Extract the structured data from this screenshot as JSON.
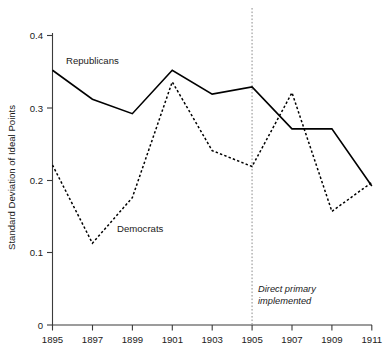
{
  "chart_data": {
    "type": "line",
    "title": "",
    "xlabel": "",
    "ylabel": "Standard Deviation of Ideal Points",
    "x": [
      1895,
      1897,
      1899,
      1901,
      1903,
      1905,
      1907,
      1909,
      1911
    ],
    "xtick_labels": [
      "1895",
      "1897",
      "1899",
      "1901",
      "1903",
      "1905",
      "1907",
      "1909",
      "1911"
    ],
    "ytick_labels": [
      "0",
      "0.1",
      "0.2",
      "0.3",
      "0.4"
    ],
    "ytick_values": [
      0,
      0.1,
      0.2,
      0.3,
      0.4
    ],
    "ylim": [
      0,
      0.4
    ],
    "xlim": [
      1895,
      1911
    ],
    "grid": false,
    "legend": "inline-labels",
    "series": [
      {
        "name": "Republicans",
        "style": "solid",
        "label_text": "Republicans",
        "values": [
          0.352,
          0.312,
          0.292,
          0.352,
          0.319,
          0.329,
          0.271,
          0.271,
          0.192
        ]
      },
      {
        "name": "Democrats",
        "style": "dashed",
        "label_text": "Democrats",
        "values": [
          0.221,
          0.113,
          0.176,
          0.336,
          0.241,
          0.219,
          0.321,
          0.157,
          0.197
        ]
      }
    ],
    "annotations": [
      {
        "name": "direct-primary-marker",
        "x": 1905,
        "line_1": "Direct primary",
        "line_2": "implemented",
        "style": "vertical-dotted-line"
      }
    ]
  },
  "colors": {
    "series_stroke": "#000000",
    "axis": "#3b3b3b",
    "event_line": "#8d8d8d",
    "background": "#ffffff"
  }
}
